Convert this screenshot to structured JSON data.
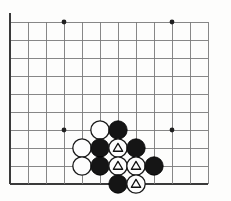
{
  "figure": {
    "kind": "go-board-diagram",
    "board": {
      "columns": 12,
      "rows": 10,
      "origin_x": 10,
      "origin_y": 22,
      "spacing": 18,
      "line_color": "#7a7a7a",
      "edge_color": "#3a3a3a",
      "edge_width": 2.6,
      "line_width": 0.9,
      "background_color": "#fdfdfc",
      "left_edge_column": 0,
      "bottom_edge_row": 9
    },
    "star_points": [
      {
        "col": 3,
        "row": 0
      },
      {
        "col": 9,
        "row": 0
      },
      {
        "col": 3,
        "row": 6
      },
      {
        "col": 9,
        "row": 6
      }
    ],
    "star_point_radius": 2.4,
    "stone_radius": 9.2,
    "stone_colors": {
      "black_fill": "#151515",
      "black_stroke": "#000000",
      "white_fill": "#fdfdfd",
      "white_stroke": "#1a1a1a"
    },
    "mark": {
      "shape": "triangle",
      "color": "#111111",
      "size": 9.0
    },
    "stones": [
      {
        "col": 5,
        "row": 6,
        "color": "white",
        "mark": null
      },
      {
        "col": 6,
        "row": 6,
        "color": "black",
        "mark": null
      },
      {
        "col": 4,
        "row": 7,
        "color": "white",
        "mark": null
      },
      {
        "col": 5,
        "row": 7,
        "color": "black",
        "mark": null
      },
      {
        "col": 6,
        "row": 7,
        "color": "white",
        "mark": "triangle"
      },
      {
        "col": 7,
        "row": 7,
        "color": "black",
        "mark": null
      },
      {
        "col": 4,
        "row": 8,
        "color": "white",
        "mark": null
      },
      {
        "col": 5,
        "row": 8,
        "color": "black",
        "mark": null
      },
      {
        "col": 6,
        "row": 8,
        "color": "white",
        "mark": "triangle"
      },
      {
        "col": 7,
        "row": 8,
        "color": "white",
        "mark": "triangle"
      },
      {
        "col": 8,
        "row": 8,
        "color": "black",
        "mark": null
      },
      {
        "col": 6,
        "row": 9,
        "color": "black",
        "mark": null
      },
      {
        "col": 7,
        "row": 9,
        "color": "white",
        "mark": "triangle"
      }
    ]
  }
}
